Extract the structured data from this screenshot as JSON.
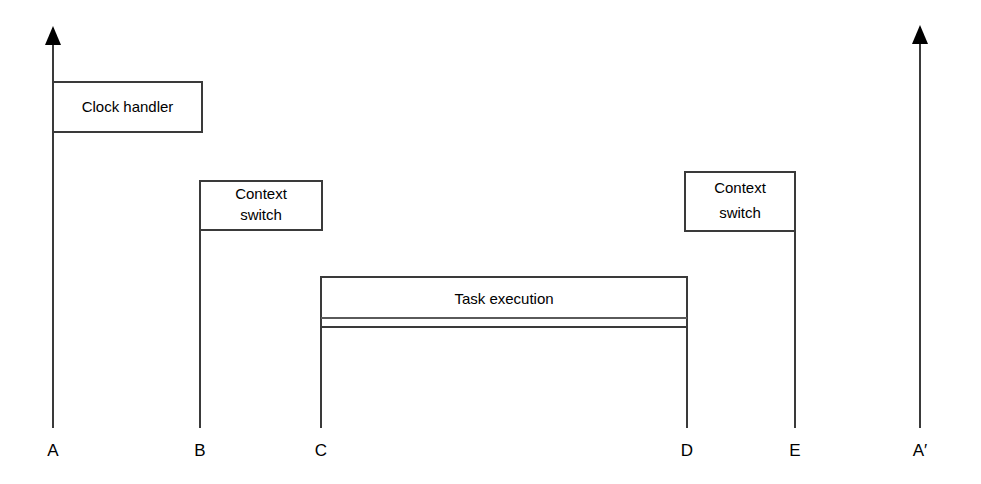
{
  "figure": {
    "kind": "timing-diagram",
    "background_color": "#ffffff",
    "line_color": "#3a3a3a",
    "text_color": "#000000",
    "width": 981,
    "height": 484
  },
  "boxes": [
    {
      "id": "clock-handler",
      "label": "Clock handler",
      "label_lines": [
        "Clock handler"
      ],
      "x": 53,
      "y": 82,
      "width": 149,
      "height": 50
    },
    {
      "id": "context-switch-1",
      "label": "Context switch",
      "label_lines": [
        "Context",
        "switch"
      ],
      "x": 200,
      "y": 181,
      "width": 122,
      "height": 49
    },
    {
      "id": "task-execution",
      "label": "Task execution",
      "label_lines": [
        "Task execution"
      ],
      "x": 321,
      "y": 277,
      "width": 366,
      "height": 50
    },
    {
      "id": "context-switch-2",
      "label": "Context switch",
      "label_lines": [
        "Context",
        "switch"
      ],
      "x": 685,
      "y": 172,
      "width": 110,
      "height": 59
    }
  ],
  "timeline_marks": [
    {
      "id": "mark-a",
      "label": "A",
      "x": 53,
      "line_top": 28,
      "line_bottom": 428,
      "has_arrow": true,
      "label_y": 452
    },
    {
      "id": "mark-b",
      "label": "B",
      "x": 200,
      "line_top": 181,
      "line_bottom": 428,
      "has_arrow": false,
      "label_y": 452
    },
    {
      "id": "mark-c",
      "label": "C",
      "x": 321,
      "line_top": 277,
      "line_bottom": 428,
      "has_arrow": false,
      "label_y": 452
    },
    {
      "id": "mark-d",
      "label": "D",
      "x": 687,
      "line_top": 277,
      "line_bottom": 428,
      "has_arrow": false,
      "label_y": 452
    },
    {
      "id": "mark-e",
      "label": "E",
      "x": 795,
      "line_top": 231,
      "line_bottom": 428,
      "has_arrow": false,
      "label_y": 452
    },
    {
      "id": "mark-a-prime",
      "label": "A′",
      "x": 920,
      "line_top": 27,
      "line_bottom": 428,
      "has_arrow": true,
      "label_y": 452
    }
  ],
  "extra_rules": [
    {
      "id": "task-inner-rule",
      "x1": 321,
      "y1": 318,
      "x2": 687,
      "y2": 318
    }
  ]
}
